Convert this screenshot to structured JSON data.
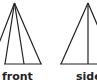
{
  "views": [
    {
      "name": "front",
      "label": "front",
      "apex": [
        14.5,
        3
      ],
      "base_y": 64,
      "base_x": [
        4,
        42
      ],
      "lines_to_base_x": [
        -9,
        5,
        24,
        41
      ]
    },
    {
      "name": "side",
      "label": "side",
      "apex": [
        88,
        3
      ],
      "base_y": 64,
      "base_x": [
        60,
        97
      ],
      "lines_to_base_x": [
        61,
        88,
        114
      ]
    }
  ],
  "colors": {
    "stroke": "#222222",
    "background": "#ffffff"
  }
}
